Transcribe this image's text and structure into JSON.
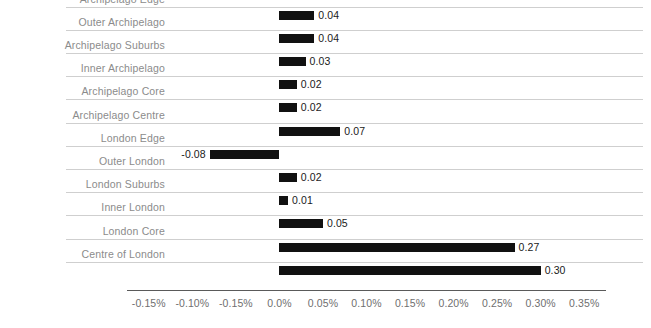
{
  "chart_data": {
    "type": "bar",
    "orientation": "horizontal",
    "title": "",
    "subtitle": "",
    "xlabel": "",
    "ylabel": "",
    "grid": true,
    "legend": null,
    "legend_position": "none",
    "bar_color": "#111111",
    "gridline_color": "#cfcfcf",
    "label_color": "#8b8b8b",
    "axis_color": "#5a5a5a",
    "value_color": "#1a1a1a",
    "xlim": [
      -0.175,
      0.375
    ],
    "x_tick_values": [
      -0.15,
      -0.1,
      -0.05,
      0.0,
      0.05,
      0.1,
      0.15,
      0.2,
      0.25,
      0.3,
      0.35
    ],
    "x_tick_labels": [
      "-0.15%",
      "-0.10%",
      "-0.15%",
      "0.0%",
      "0.05%",
      "0.10%",
      "0.15%",
      "0.20%",
      "0.25%",
      "0.30%",
      "0.35%"
    ],
    "categories": [
      "Archipelago Edge",
      "Outer Archipelago",
      "Archipelago Suburbs",
      "Inner Archipelago",
      "Archipelago Core",
      "Archipelago Centre",
      "London Edge",
      "Outer London",
      "London Suburbs",
      "Inner London",
      "London Core",
      "Centre of London"
    ],
    "values": [
      0.04,
      0.04,
      0.03,
      0.02,
      0.02,
      0.07,
      -0.08,
      0.02,
      0.01,
      0.05,
      0.27,
      0.3
    ],
    "value_labels": [
      "0.04",
      "0.04",
      "0.03",
      "0.02",
      "0.02",
      "0.07",
      "-0.08",
      "0.02",
      "0.01",
      "0.05",
      "0.27",
      "0.30"
    ]
  }
}
